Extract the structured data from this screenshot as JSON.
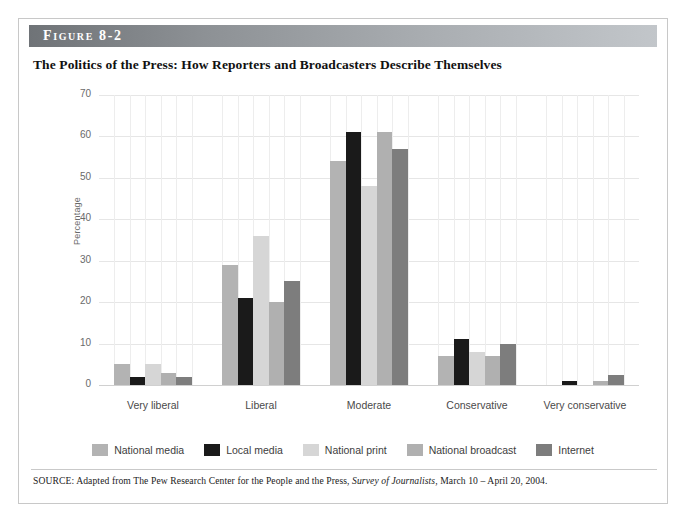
{
  "figure": {
    "label": "Figure 8-2",
    "title": "The Politics of the Press: How Reporters and Broadcasters Describe Themselves",
    "source_prefix": "SOURCE: Adapted from The Pew Research Center for the People and the Press, ",
    "source_italic": "Survey of Journalists",
    "source_suffix": ", March 10 – April 20, 2004."
  },
  "colors": {
    "national_media": "#b3b3b3",
    "local_media": "#1a1a1a",
    "national_print": "#d6d6d6",
    "national_broadcast": "#b0b0b0",
    "internet": "#7d7d7d",
    "gridline": "#e6e6e6",
    "axis_text": "#6a6a6a",
    "header_start": "#6f7377",
    "header_end": "#c2c6ca"
  },
  "chart_data": {
    "type": "bar",
    "title": "The Politics of the Press: How Reporters and Broadcasters Describe Themselves",
    "xlabel": "",
    "ylabel": "Percentage",
    "ylim": [
      0,
      70
    ],
    "yticks": [
      0,
      10,
      20,
      30,
      40,
      50,
      60,
      70
    ],
    "grid": true,
    "legend_position": "bottom",
    "categories": [
      "Very liberal",
      "Liberal",
      "Moderate",
      "Conservative",
      "Very conservative"
    ],
    "series": [
      {
        "name": "National media",
        "color": "#b3b3b3",
        "values": [
          5,
          29,
          54,
          7,
          0
        ]
      },
      {
        "name": "Local media",
        "color": "#1a1a1a",
        "values": [
          2,
          21,
          61,
          11,
          1
        ]
      },
      {
        "name": "National print",
        "color": "#d6d6d6",
        "values": [
          5,
          36,
          48,
          8,
          0
        ]
      },
      {
        "name": "National broadcast",
        "color": "#b0b0b0",
        "values": [
          3,
          20,
          61,
          7,
          1
        ]
      },
      {
        "name": "Internet",
        "color": "#7d7d7d",
        "values": [
          2,
          25,
          57,
          10,
          2.5
        ]
      }
    ]
  }
}
